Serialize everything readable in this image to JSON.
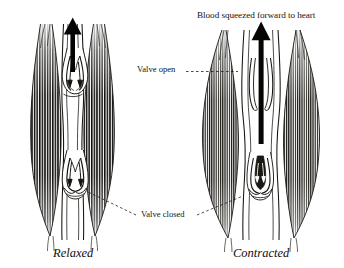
{
  "figure": {
    "kind": "anatomical-diagram",
    "background_color": "#ffffff",
    "ink_color": "#15130f"
  },
  "annotations": {
    "blood_flow_title": "Blood squeezed forward to heart",
    "valve_open": "Valve open",
    "valve_closed": "Valve closed"
  },
  "panels": [
    {
      "id": "left",
      "caption": "Relaxed",
      "arrow": "up-arrow-short",
      "valves": [
        "open",
        "closed"
      ]
    },
    {
      "id": "right",
      "caption": "Contracted",
      "arrow": "up-arrow-long",
      "valves": [
        "open-flat",
        "closed-compressed"
      ]
    }
  ],
  "captions": {
    "left": "Relaxed",
    "right": "Contracted"
  },
  "icons": {
    "blood_flow_arrow": "up-arrow-icon",
    "valve_flow_arrow": "down-arrow-icon",
    "leader": "dashed-leader-line-icon"
  }
}
